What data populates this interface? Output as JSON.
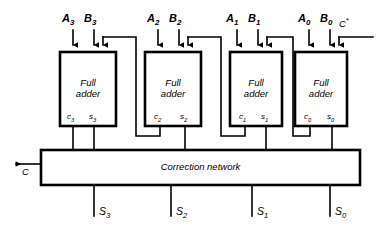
{
  "figure": {
    "kind": "logic-block-diagram"
  },
  "adders": [
    {
      "id": "adder-3",
      "title_line1": "Full",
      "title_line2": "adder",
      "input_a": "A",
      "input_a_sub": "3",
      "input_b": "B",
      "input_b_sub": "3",
      "carry_out": "c",
      "carry_out_sub": "3",
      "sum_out": "s",
      "sum_out_sub": "3"
    },
    {
      "id": "adder-2",
      "title_line1": "Full",
      "title_line2": "adder",
      "input_a": "A",
      "input_a_sub": "2",
      "input_b": "B",
      "input_b_sub": "2",
      "carry_out": "c",
      "carry_out_sub": "2",
      "sum_out": "s",
      "sum_out_sub": "2"
    },
    {
      "id": "adder-1",
      "title_line1": "Full",
      "title_line2": "adder",
      "input_a": "A",
      "input_a_sub": "1",
      "input_b": "B",
      "input_b_sub": "1",
      "carry_out": "c",
      "carry_out_sub": "1",
      "sum_out": "s",
      "sum_out_sub": "1"
    },
    {
      "id": "adder-0",
      "title_line1": "Full",
      "title_line2": "adder",
      "input_a": "A",
      "input_a_sub": "0",
      "input_b": "B",
      "input_b_sub": "0",
      "carry_out": "c",
      "carry_out_sub": "0",
      "sum_out": "s",
      "sum_out_sub": "0"
    }
  ],
  "correction_network": {
    "label": "Correction network"
  },
  "carry_in": {
    "label": "C",
    "superscript": "*"
  },
  "carry_out": {
    "label": "C"
  },
  "sum_outputs": [
    {
      "label": "S",
      "sub": "3"
    },
    {
      "label": "S",
      "sub": "2"
    },
    {
      "label": "S",
      "sub": "1"
    },
    {
      "label": "S",
      "sub": "0"
    }
  ],
  "colors": {
    "line": "#000000",
    "background": "#ffffff",
    "text": "#000000"
  }
}
